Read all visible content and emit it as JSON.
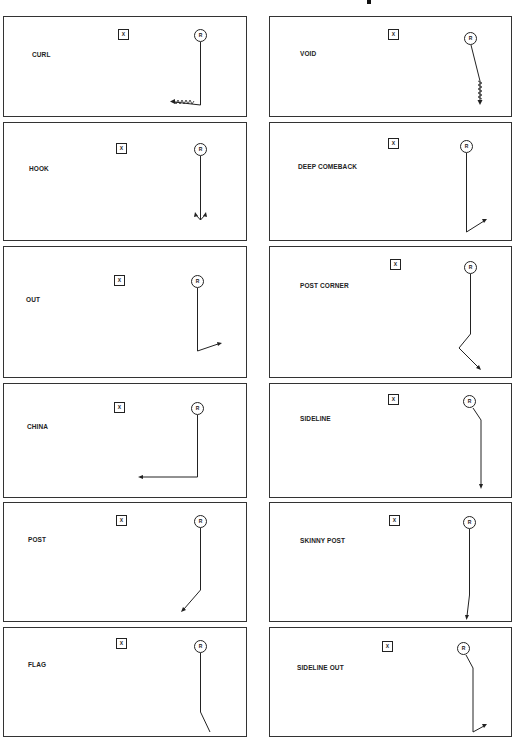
{
  "title_fragment": "",
  "markers": {
    "defender": "X",
    "receiver": "R"
  },
  "panels": [
    {
      "id": "curl",
      "label": "CURL",
      "column": "left",
      "row": 1
    },
    {
      "id": "void",
      "label": "VOID",
      "column": "right",
      "row": 1
    },
    {
      "id": "hook",
      "label": "HOOK",
      "column": "left",
      "row": 2
    },
    {
      "id": "deep-comeback",
      "label": "DEEP COMEBACK",
      "column": "right",
      "row": 2
    },
    {
      "id": "out",
      "label": "OUT",
      "column": "left",
      "row": 3
    },
    {
      "id": "post-corner",
      "label": "POST CORNER",
      "column": "right",
      "row": 3
    },
    {
      "id": "china",
      "label": "CHINA",
      "column": "left",
      "row": 4
    },
    {
      "id": "sideline",
      "label": "SIDELINE",
      "column": "right",
      "row": 4
    },
    {
      "id": "post",
      "label": "POST",
      "column": "left",
      "row": 5
    },
    {
      "id": "skinny-post",
      "label": "SKINNY POST",
      "column": "right",
      "row": 5
    },
    {
      "id": "flag",
      "label": "FLAG",
      "column": "left",
      "row": 6
    },
    {
      "id": "sideline-out",
      "label": "SIDELINE  OUT",
      "column": "right",
      "row": 6
    }
  ]
}
